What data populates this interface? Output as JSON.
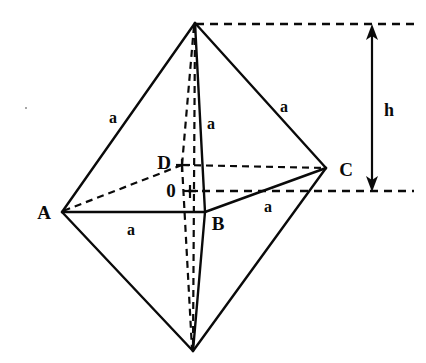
{
  "figure": {
    "stroke_color": "#0a0a0a",
    "background_color": "#ffffff",
    "vertices": [
      {
        "id": "apex",
        "name": "top-apex",
        "x": 195,
        "y": 23,
        "label": "",
        "label_x": 0,
        "label_y": 0
      },
      {
        "id": "A",
        "name": "vertex-a",
        "x": 62,
        "y": 212,
        "label": "A",
        "label_x": 44,
        "label_y": 212
      },
      {
        "id": "B",
        "name": "vertex-b",
        "x": 205,
        "y": 212,
        "label": "B",
        "label_x": 218,
        "label_y": 223
      },
      {
        "id": "C",
        "name": "vertex-c",
        "x": 326,
        "y": 168,
        "label": "C",
        "label_x": 346,
        "label_y": 169
      },
      {
        "id": "D",
        "name": "vertex-d",
        "x": 182,
        "y": 165,
        "label": "D",
        "label_x": 164,
        "label_y": 162
      },
      {
        "id": "O",
        "name": "center-o",
        "x": 190,
        "y": 191,
        "label": "0",
        "label_x": 171,
        "label_y": 190
      },
      {
        "id": "bottom",
        "name": "bottom-apex",
        "x": 193,
        "y": 351,
        "label": "",
        "label_x": 0,
        "label_y": 0
      }
    ],
    "edge_labels": [
      {
        "id": "a-apex-A",
        "text": "a",
        "x": 113,
        "y": 118
      },
      {
        "id": "a-apex-B",
        "text": "a",
        "x": 211,
        "y": 124
      },
      {
        "id": "a-apex-C",
        "text": "a",
        "x": 284,
        "y": 107
      },
      {
        "id": "a-A-B",
        "text": "a",
        "x": 131,
        "y": 230
      },
      {
        "id": "a-B-C",
        "text": "a",
        "x": 268,
        "y": 207
      }
    ],
    "height_marker": {
      "label": "h",
      "label_x": 389,
      "label_y": 110,
      "axis_x": 372,
      "top_y": 26,
      "bottom_y": 191
    },
    "reference_lines": {
      "top_dash_y": 24,
      "top_dash_x1": 196,
      "top_dash_x2": 414,
      "bottom_dash_y": 191,
      "bottom_dash_x1": 188,
      "bottom_dash_x2": 414
    }
  },
  "notation": {
    "edge_length_symbol": "a",
    "height_symbol": "h",
    "center_symbol": "0",
    "vertex_symbols": [
      "A",
      "B",
      "C",
      "D"
    ]
  }
}
